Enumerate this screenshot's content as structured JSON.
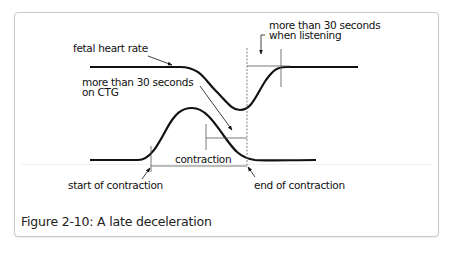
{
  "figure": {
    "caption": "Figure 2-10: A late deceleration",
    "labels": {
      "fetal_heart_rate": "fetal heart rate",
      "more_than_30_ctg_line1": "more than 30 seconds",
      "more_than_30_ctg_line2": "on CTG",
      "more_than_30_listening_line1": "more than 30 seconds",
      "more_than_30_listening_line2": "when listening",
      "contraction": "contraction",
      "start_of_contraction": "start of contraction",
      "end_of_contraction": "end of contraction"
    },
    "colors": {
      "curve": "#111111",
      "guide": "#555555",
      "border": "#c9c9c9"
    }
  }
}
